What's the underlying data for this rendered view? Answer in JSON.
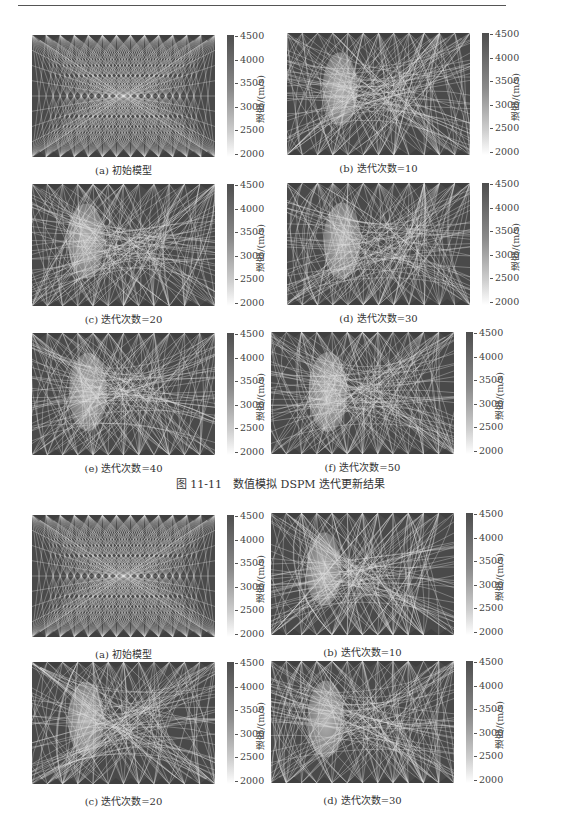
{
  "figure1": {
    "caption": "图 11-11　数值模拟 DSPM 迭代更新结果",
    "panels": [
      {
        "label": "(a)  初始模型",
        "iteration": 0
      },
      {
        "label": "(b)  迭代次数=10",
        "iteration": 10
      },
      {
        "label": "(c)  迭代次数=20",
        "iteration": 20
      },
      {
        "label": "(d)  迭代次数=30",
        "iteration": 30
      },
      {
        "label": "(e)  迭代次数=40",
        "iteration": 40
      },
      {
        "label": "(f)  迭代次数=50",
        "iteration": 50
      }
    ]
  },
  "figure2": {
    "panels": [
      {
        "label": "(a)  初始模型",
        "iteration": 0
      },
      {
        "label": "(b)  迭代次数=10",
        "iteration": 10
      },
      {
        "label": "(c)  迭代次数=20",
        "iteration": 20
      },
      {
        "label": "(d)  迭代次数=30",
        "iteration": 30
      }
    ]
  },
  "colorbar": {
    "label": "速度/(m/s)",
    "ticks": [
      "4500",
      "4000",
      "3500",
      "3000",
      "2500",
      "2000"
    ],
    "min": 2000,
    "max": 4500,
    "color_high": "#4e4e4e",
    "color_low": "#ffffff"
  },
  "colors": {
    "background": "#4a4a4a",
    "ray": "#e6e6e6",
    "anomaly": "#9a9a9a"
  }
}
